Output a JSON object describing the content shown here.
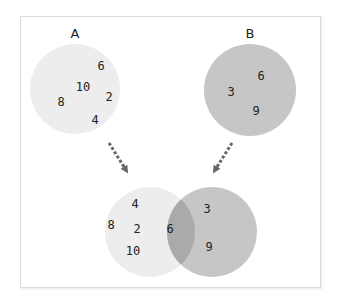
{
  "colors": {
    "set_a_fill": "#ededed",
    "set_b_fill": "#c6c6c6",
    "intersection_fill": "#aaaaaa",
    "arrow": "#666666",
    "text": "#222222",
    "frame_border": "#dcdcdc"
  },
  "set_a": {
    "label": "A",
    "elements": [
      "6",
      "10",
      "2",
      "8",
      "4"
    ]
  },
  "set_b": {
    "label": "B",
    "elements": [
      "6",
      "3",
      "9"
    ]
  },
  "union": {
    "a_only": [
      "4",
      "8",
      "2",
      "10"
    ],
    "intersection": [
      "6"
    ],
    "b_only": [
      "3",
      "9"
    ]
  }
}
